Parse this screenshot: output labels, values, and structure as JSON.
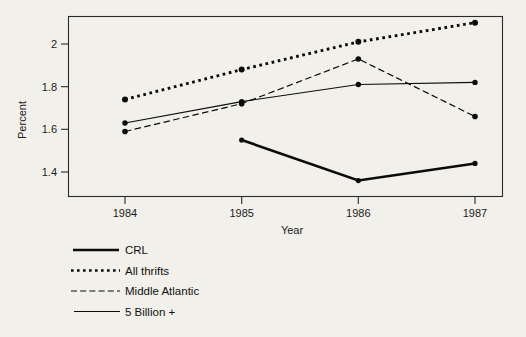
{
  "chart_data": {
    "type": "line",
    "title": "",
    "xlabel": "Year",
    "ylabel": "Percent",
    "categories": [
      "1984",
      "1985",
      "1986",
      "1987"
    ],
    "x": [
      1984,
      1985,
      1986,
      1987
    ],
    "xlim": [
      1983.6,
      1987.4
    ],
    "ylim": [
      1.29,
      2.14
    ],
    "yticks": [
      1.4,
      1.6,
      1.8,
      2.0
    ],
    "ytick_labels": [
      "1.4",
      "1.6",
      "1.8",
      "2"
    ],
    "xticks": [
      1984,
      1985,
      1986,
      1987
    ],
    "xtick_labels": [
      "1984",
      "1985",
      "1986",
      "1987"
    ],
    "grid": false,
    "legend_position": "below-left",
    "series": [
      {
        "name": "CRL",
        "style": "solid-thick",
        "x": [
          1985,
          1986,
          1987
        ],
        "values": [
          1.55,
          1.36,
          1.44
        ],
        "markers": true
      },
      {
        "name": "All thrifts",
        "style": "dotted",
        "x": [
          1984,
          1985,
          1986,
          1987
        ],
        "values": [
          1.74,
          1.88,
          2.01,
          2.1
        ],
        "markers": true
      },
      {
        "name": "Middle Atlantic",
        "style": "dashed",
        "x": [
          1984,
          1985,
          1986,
          1987
        ],
        "values": [
          1.59,
          1.72,
          1.93,
          1.66
        ],
        "markers": true
      },
      {
        "name": "5 Billion +",
        "style": "solid-thin",
        "x": [
          1984,
          1985,
          1986,
          1987
        ],
        "values": [
          1.63,
          1.73,
          1.81,
          1.82
        ],
        "markers": true
      }
    ]
  },
  "legend": {
    "items": [
      {
        "label": "CRL",
        "style": "solid-thick"
      },
      {
        "label": "All thrifts",
        "style": "dotted"
      },
      {
        "label": "Middle Atlantic",
        "style": "dashed"
      },
      {
        "label": "5 Billion +",
        "style": "solid-thin"
      }
    ]
  },
  "colors": {
    "background": "#f1f0ea",
    "ink": "#0b0b0b",
    "frame": "#2a2a2a"
  }
}
